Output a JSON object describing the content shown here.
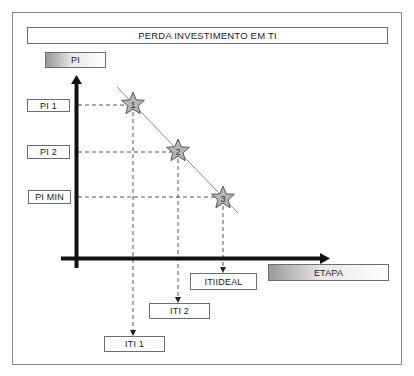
{
  "title": "PERDA INVESTIMENTO EM TI",
  "y_axis": {
    "label": "PI"
  },
  "x_axis": {
    "label": "ETAPA"
  },
  "y_ticks": [
    {
      "label": "PI 1"
    },
    {
      "label": "PI 2"
    },
    {
      "label": "PI MIN"
    }
  ],
  "x_ticks": [
    {
      "label": "ITI 1"
    },
    {
      "label": "ITI 2"
    },
    {
      "label": "ITIIDEAL"
    }
  ],
  "points": [
    {
      "label": "1",
      "y_ref": "PI 1",
      "x_ref": "ITI 1"
    },
    {
      "label": "2",
      "y_ref": "PI 2",
      "x_ref": "ITI 2"
    },
    {
      "label": "3",
      "y_ref": "PI MIN",
      "x_ref": "ITIIDEAL"
    }
  ],
  "colors": {
    "axis": "#111111",
    "dashed": "#555555",
    "trend_line": "#888888",
    "star_fill": "#b5b5b5",
    "star_stroke": "#555555",
    "box_border": "#6e6e6e"
  }
}
